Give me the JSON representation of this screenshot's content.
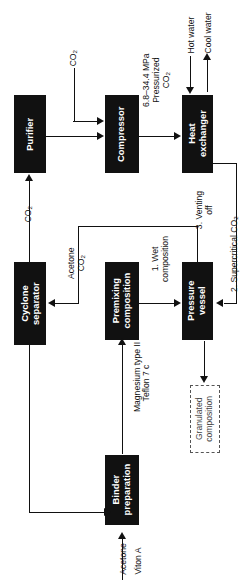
{
  "diagram": {
    "orientation": "rotated-90-ccw",
    "box_fill": "#111111",
    "line_color": "#111111",
    "dashed_box_color": "#555555"
  },
  "nodes": [
    {
      "id": "purifier",
      "label": "Purifier"
    },
    {
      "id": "compressor",
      "label": "Compressor"
    },
    {
      "id": "heat_exchanger",
      "label": "Heat\nexchanger"
    },
    {
      "id": "cyclone",
      "label": "Cyclone\nseparator"
    },
    {
      "id": "premixing",
      "label": "Premixing\ncomposition"
    },
    {
      "id": "pressure",
      "label": "Pressure\nvessel"
    },
    {
      "id": "binder",
      "label": "Binder\npreparation"
    },
    {
      "id": "granulated",
      "label": "Granulated\ncomposition"
    }
  ],
  "labels": {
    "co2_feed": "CO2",
    "pressurized": "6.8–34.4 MPa\nPressurized\nCO2",
    "hot_water": "Hot water",
    "cool_water": "Cool water",
    "co2_recycle": "CO2",
    "acetone_co2": "Acetone\nCO2",
    "wet_composition": "1. Wet\ncomposition",
    "supercritical": "2. Supercritical CO2",
    "venting": "3. Venting\noff",
    "magnesium": "Magnesium type II",
    "teflon": "Teflon 7 c",
    "acetone": "Acetone",
    "viton": "Viton A"
  }
}
